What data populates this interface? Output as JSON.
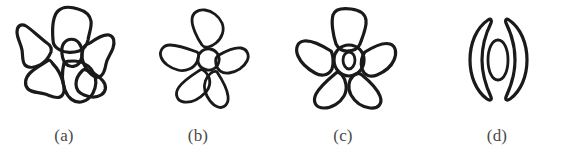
{
  "figure": {
    "title": "",
    "background_color": "#ffffff",
    "ink_color": "#1a1a1a",
    "caption_color": "#4a4a4a",
    "panel_count": 4
  },
  "panels": [
    {
      "id": "a",
      "caption": "(a)",
      "icon_name": "flower-six-petal-rounded-icon",
      "description": "hand-drawn flower with six broad rounded overlapping petals and an egg-shaped offset center",
      "petal_count": 6,
      "center_shape": "egg",
      "view": "face-on"
    },
    {
      "id": "b",
      "caption": "(b)",
      "icon_name": "flower-five-petal-separated-icon",
      "description": "hand-drawn flower with five separated teardrop petals around a small round center",
      "petal_count": 5,
      "center_shape": "small-circle",
      "view": "face-on"
    },
    {
      "id": "c",
      "caption": "(c)",
      "icon_name": "flower-five-petal-ring-center-icon",
      "description": "hand-drawn flower with five petals joined to a thick annular ring center containing an inner oval",
      "petal_count": 5,
      "center_shape": "ring-with-inner-oval",
      "view": "face-on"
    },
    {
      "id": "d",
      "caption": "(d)",
      "icon_name": "flower-profile-two-crescent-icon",
      "description": "hand-drawn flower seen in profile: two opposing crescent petals flanking a narrow vertical oval",
      "petal_count": 2,
      "center_shape": "narrow-vertical-oval",
      "view": "side"
    }
  ]
}
